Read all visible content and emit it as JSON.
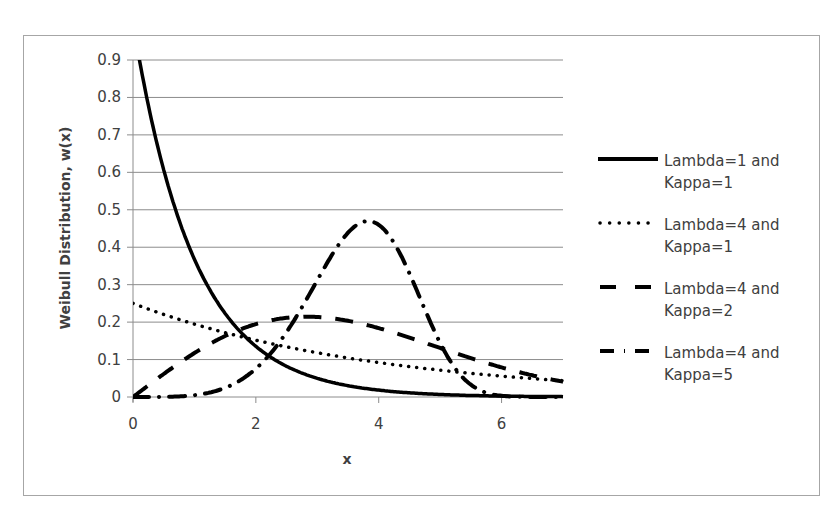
{
  "chart_data": {
    "type": "line",
    "title": "",
    "xlabel": "x",
    "ylabel": "Weibull Distribution, w(x)",
    "xlim": [
      0,
      7
    ],
    "ylim": [
      0,
      0.9
    ],
    "x_ticks": [
      "0",
      "2",
      "4",
      "6"
    ],
    "y_ticks": [
      "0",
      "0.1",
      "0.2",
      "0.3",
      "0.4",
      "0.5",
      "0.6",
      "0.7",
      "0.8",
      "0.9"
    ],
    "grid": "horizontal",
    "legend_position": "right",
    "x": [
      0,
      0.5,
      1,
      1.5,
      2,
      2.5,
      3,
      3.5,
      4,
      4.5,
      5,
      5.5,
      6,
      6.5,
      7
    ],
    "series": [
      {
        "name": "Lambda=1 and Kappa=1",
        "style": "solid",
        "lambda": 1,
        "kappa": 1,
        "values": [
          1.0,
          0.607,
          0.368,
          0.223,
          0.135,
          0.082,
          0.05,
          0.03,
          0.018,
          0.011,
          0.007,
          0.004,
          0.002,
          0.002,
          0.001
        ]
      },
      {
        "name": "Lambda=4 and Kappa=1",
        "style": "dotted",
        "lambda": 4,
        "kappa": 1,
        "values": [
          0.25,
          0.221,
          0.195,
          0.172,
          0.152,
          0.134,
          0.118,
          0.104,
          0.092,
          0.081,
          0.072,
          0.063,
          0.056,
          0.049,
          0.043
        ]
      },
      {
        "name": "Lambda=4 and Kappa=2",
        "style": "dashed",
        "lambda": 4,
        "kappa": 2,
        "values": [
          0,
          0.062,
          0.118,
          0.162,
          0.195,
          0.212,
          0.214,
          0.203,
          0.184,
          0.159,
          0.131,
          0.104,
          0.079,
          0.058,
          0.041
        ]
      },
      {
        "name": "Lambda=4 and Kappa=5",
        "style": "dash-dot",
        "lambda": 4,
        "kappa": 5,
        "values": [
          0,
          0.0003,
          0.005,
          0.025,
          0.075,
          0.17,
          0.306,
          0.436,
          0.46,
          0.275,
          0.053,
          0.001,
          0,
          0,
          0
        ]
      }
    ]
  },
  "legend": {
    "items": [
      {
        "line1": "Lambda=1 and",
        "line2": "Kappa=1"
      },
      {
        "line1": "Lambda=4 and",
        "line2": "Kappa=1"
      },
      {
        "line1": "Lambda=4 and",
        "line2": "Kappa=2"
      },
      {
        "line1": "Lambda=4 and",
        "line2": "Kappa=5"
      }
    ]
  }
}
